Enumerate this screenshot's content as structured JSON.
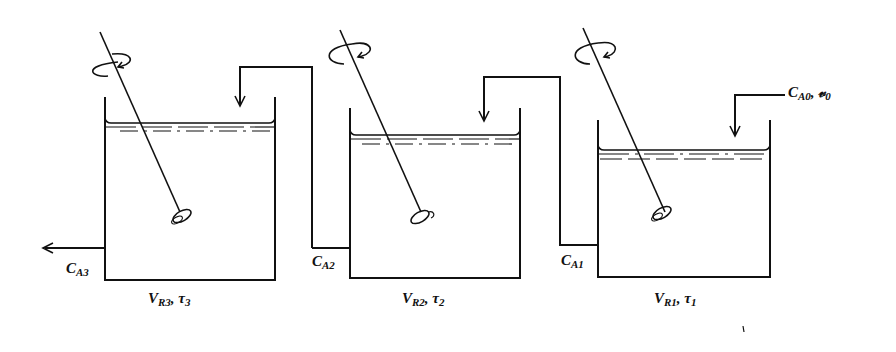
{
  "diagram": {
    "type": "three CSTRs in series",
    "tanks": [
      {
        "id": "tank-1",
        "volume_label": "V",
        "volume_sub": "R1",
        "tau_label": "τ",
        "tau_sub": "1",
        "outlet_label": "C",
        "outlet_sub": "A1"
      },
      {
        "id": "tank-2",
        "volume_label": "V",
        "volume_sub": "R2",
        "tau_label": "τ",
        "tau_sub": "2",
        "outlet_label": "C",
        "outlet_sub": "A2"
      },
      {
        "id": "tank-3",
        "volume_label": "V",
        "volume_sub": "R3",
        "tau_label": "τ",
        "tau_sub": "3",
        "outlet_label": "C",
        "outlet_sub": "A3"
      }
    ],
    "feed": {
      "conc_label": "C",
      "conc_sub": "A0",
      "flow_label": "𝓋",
      "flow_sub": "0"
    },
    "separator": ", ",
    "stroke_color": "#111111",
    "background": "#ffffff"
  }
}
